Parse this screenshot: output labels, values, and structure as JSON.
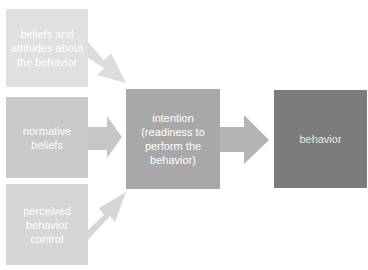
{
  "diagram": {
    "inputs": [
      {
        "label": "beliefs and\nattitudes about\nthe behavior"
      },
      {
        "label": "normative\nbeliefs"
      },
      {
        "label": "perceived\nbehavior\ncontrol"
      }
    ],
    "intention": {
      "label": "intention\n(readiness to\nperform the\nbehavior)"
    },
    "behavior": {
      "label": "behavior"
    },
    "edges": [
      {
        "from": "beliefs and attitudes about the behavior",
        "to": "intention"
      },
      {
        "from": "normative beliefs",
        "to": "intention"
      },
      {
        "from": "perceived behavior control",
        "to": "intention"
      },
      {
        "from": "intention",
        "to": "behavior"
      }
    ],
    "colors": {
      "input_1": "#e0e0e0",
      "input_2": "#c9c9c9",
      "input_3": "#d6d6d6",
      "intention": "#a8a8a8",
      "behavior": "#7c7c7c",
      "arrow_light": "#dcdcdc",
      "arrow_mid": "#c6c6c6",
      "arrow_dark": "#b4b4b4"
    }
  }
}
